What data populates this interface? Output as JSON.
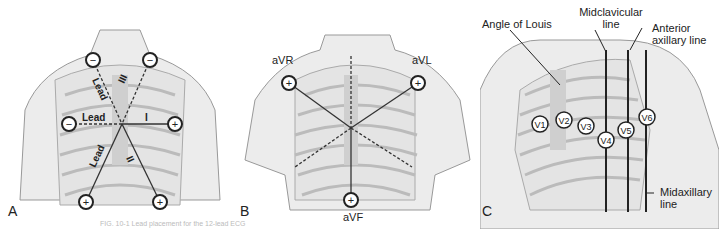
{
  "figure": {
    "caption": "FIG. 10-1 Lead placement for the 12-lead ECG",
    "panels": [
      {
        "id": "A",
        "title": "A",
        "labels": {
          "lead_left": "Lead",
          "lead_mid": "Lead",
          "lead_lower": "Lead",
          "lead_I": "I",
          "lead_II": "II",
          "lead_III": "III"
        },
        "electrodes": [
          "−",
          "−",
          "−",
          "+",
          "+",
          "+"
        ]
      },
      {
        "id": "B",
        "title": "B",
        "labels": {
          "avr": "aVR",
          "avl": "aVL",
          "avf": "aVF"
        },
        "electrodes": [
          "+",
          "+",
          "+"
        ]
      },
      {
        "id": "C",
        "title": "C",
        "labels": {
          "angle_of_louis": "Angle of Louis",
          "midclavicular": "Midclavicular line",
          "anterior_axillary": "Anterior axillary line",
          "midaxillary": "Midaxillary line"
        },
        "electrodes": [
          "V1",
          "V2",
          "V3",
          "V4",
          "V5",
          "V6"
        ]
      }
    ]
  },
  "colors": {
    "skin": "#ececec",
    "bone": "#cfcfcf",
    "ink": "#222222",
    "line": "#333333"
  }
}
